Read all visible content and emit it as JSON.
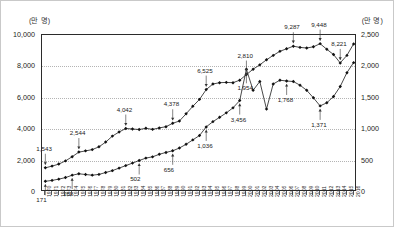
{
  "chart_data": {
    "type": "line",
    "title": "",
    "xlabel": "",
    "ylabel_left": "(만 명)",
    "ylabel_right": "(만 명)",
    "grid": true,
    "legend": "none",
    "ylim_left": [
      0,
      10000
    ],
    "ylim_right": [
      0,
      2500
    ],
    "yticks_left": [
      "0",
      "2,000",
      "4,000",
      "6,000",
      "8,000",
      "10,000"
    ],
    "yticks_right": [
      "0",
      "500",
      "1,000",
      "1,500",
      "2,000",
      "2,500"
    ],
    "x": [
      "1970",
      "1971",
      "1972",
      "1973",
      "1974",
      "1975",
      "1976",
      "1977",
      "1978",
      "1979",
      "1980",
      "1981",
      "1982",
      "1983",
      "1984",
      "1985",
      "1986",
      "1987",
      "1988",
      "1989",
      "1990",
      "1991",
      "1992",
      "1993",
      "1994",
      "1995",
      "1996",
      "1997",
      "1998",
      "1999",
      "2000",
      "2001",
      "2002",
      "2003",
      "2004",
      "2005",
      "2006",
      "2007",
      "2008",
      "2009",
      "2010",
      "2011",
      "2012",
      "2013",
      "2014",
      "2015",
      "2016"
    ],
    "series": [
      {
        "name": "상위 계열 (좌축)",
        "axis": "left",
        "marker": "diamond",
        "values": [
          1543,
          1650,
          1780,
          1980,
          2250,
          2544,
          2620,
          2700,
          2880,
          3180,
          3560,
          3820,
          4042,
          4010,
          3980,
          4060,
          3990,
          4080,
          4160,
          4378,
          4520,
          4980,
          5460,
          5900,
          6525,
          6880,
          6960,
          6980,
          6960,
          7120,
          7480,
          7820,
          8100,
          8420,
          8700,
          8960,
          9120,
          9287,
          9210,
          9170,
          9250,
          9448,
          9090,
          8760,
          8221,
          8700,
          9430
        ]
      },
      {
        "name": "하위 계열 (우축)",
        "axis": "right",
        "marker": "diamond",
        "values": [
          171,
          185,
          205,
          230,
          268,
          290,
          278,
          268,
          280,
          310,
          340,
          380,
          420,
          460,
          502,
          540,
          560,
          600,
          630,
          656,
          700,
          760,
          830,
          900,
          1036,
          1120,
          1190,
          1260,
          1340,
          1456,
          1954,
          1620,
          1760,
          1320,
          1720,
          1780,
          1768,
          1760,
          1700,
          1620,
          1500,
          1371,
          1420,
          1520,
          1680,
          1900,
          2060
        ]
      }
    ],
    "annotations_left": [
      {
        "label": "1,543",
        "x": "1970"
      },
      {
        "label": "2,544",
        "x": "1975"
      },
      {
        "label": "4,042",
        "x": "1982"
      },
      {
        "label": "4,378",
        "x": "1989"
      },
      {
        "label": "6,525",
        "x": "1994"
      },
      {
        "label": "2,810",
        "x": "2000"
      },
      {
        "label": "9,287",
        "x": "2007"
      },
      {
        "label": "9,448",
        "x": "2011"
      },
      {
        "label": "8,221",
        "x": "2014"
      }
    ],
    "annotations_right": [
      {
        "label": "171",
        "x": "1970"
      },
      {
        "label": "268",
        "x": "1974"
      },
      {
        "label": "502",
        "x": "1984"
      },
      {
        "label": "656",
        "x": "1989"
      },
      {
        "label": "1,036",
        "x": "1994"
      },
      {
        "label": "3,456",
        "x": "1999"
      },
      {
        "label": "1,954",
        "x": "2000"
      },
      {
        "label": "1,768",
        "x": "2006"
      },
      {
        "label": "1,371",
        "x": "2011"
      }
    ]
  }
}
